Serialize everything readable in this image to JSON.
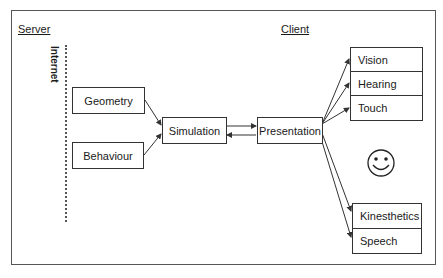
{
  "diagram": {
    "sections": {
      "server": "Server",
      "client": "Client",
      "internet": "Internet"
    },
    "nodes": {
      "geometry": "Geometry",
      "behaviour": "Behaviour",
      "simulation": "Simulation",
      "presentation": "Presentation"
    },
    "senses_top": [
      "Vision",
      "Hearing",
      "Touch"
    ],
    "senses_bottom": [
      "Kinesthetics",
      "Speech"
    ],
    "user_icon": "smiley-face-icon",
    "edges": [
      {
        "from": "Geometry",
        "to": "Simulation"
      },
      {
        "from": "Behaviour",
        "to": "Simulation"
      },
      {
        "from": "Simulation",
        "to": "Presentation"
      },
      {
        "from": "Presentation",
        "to": "Simulation"
      },
      {
        "from": "Presentation",
        "to": "Vision"
      },
      {
        "from": "Presentation",
        "to": "Hearing"
      },
      {
        "from": "Presentation",
        "to": "Touch"
      },
      {
        "from": "Presentation",
        "to": "Kinesthetics"
      },
      {
        "from": "Presentation",
        "to": "Speech"
      }
    ],
    "colors": {
      "line": "#333333",
      "background": "#ffffff"
    }
  }
}
